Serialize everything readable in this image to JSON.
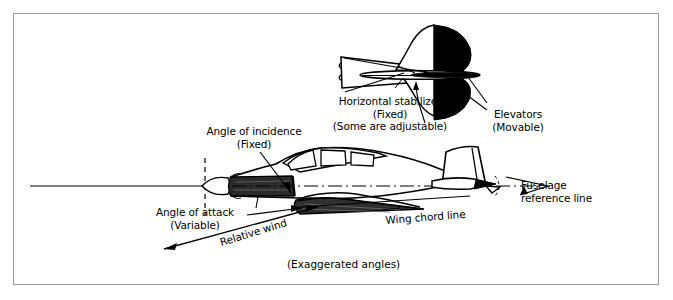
{
  "figure": {
    "title_caption": "(Exaggerated angles)",
    "border_color": "#9a9a9a",
    "ink_color": "#000000",
    "background_color": "#ffffff"
  },
  "labels": {
    "horizontal_stabilizer": {
      "line1": "Horizontal stabilizer",
      "line2": "(Fixed)",
      "line3": "(Some are adjustable)"
    },
    "elevators": {
      "line1": "Elevators",
      "line2": "(Movable)"
    },
    "angle_of_incidence": {
      "line1": "Angle of incidence",
      "line2": "(Fixed)"
    },
    "angle_of_attack": {
      "line1": "Angle of attack",
      "line2": "(Variable)"
    },
    "relative_wind": "Relative wind",
    "wing_chord_line": "Wing chord line",
    "fuselage_reference_line": {
      "line1": "Fuselage",
      "line2": "reference line"
    }
  }
}
